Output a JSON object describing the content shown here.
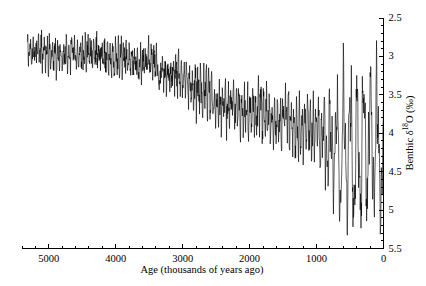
{
  "chart_data": {
    "type": "line",
    "title": "",
    "xlabel": "Age (thousands of years ago)",
    "ylabel_plain": "Benthic d18O (per mil)",
    "ylabel_prefix": "Benthic δ",
    "ylabel_sup": "18",
    "ylabel_suffix": "O (‰)",
    "xlim": [
      5400,
      0
    ],
    "ylim": [
      5.5,
      2.5
    ],
    "x_inverted": true,
    "y_inverted": true,
    "grid": false,
    "legend": false,
    "legend_position": "none",
    "line_color": "#000000",
    "background_color": "#ffffff",
    "axis_position": {
      "x": "bottom",
      "y": "right"
    },
    "xticks": [
      5000,
      4000,
      3000,
      2000,
      1000,
      0
    ],
    "xtick_labels": [
      "5000",
      "4000",
      "3000",
      "2000",
      "1000",
      "0"
    ],
    "x_minor_tick_interval": 200,
    "yticks": [
      2.5,
      3,
      3.5,
      4,
      4.5,
      5,
      5.5
    ],
    "ytick_labels": [
      "2.5",
      "3",
      "3.5",
      "4",
      "4.5",
      "5",
      "5.5"
    ],
    "y_minor_tick_interval": 0.1,
    "series_name": "Benthic δ¹⁸O stack",
    "x_start": 5320,
    "x_end": 0,
    "n_points": 1330,
    "envelope_keypoints": [
      {
        "age": 5320,
        "mean": 2.95,
        "amplitude": 0.24
      },
      {
        "age": 5000,
        "mean": 2.96,
        "amplitude": 0.26
      },
      {
        "age": 4600,
        "mean": 2.99,
        "amplitude": 0.24
      },
      {
        "age": 4300,
        "mean": 2.96,
        "amplitude": 0.22
      },
      {
        "age": 4000,
        "mean": 3.02,
        "amplitude": 0.24
      },
      {
        "age": 3700,
        "mean": 3.06,
        "amplitude": 0.24
      },
      {
        "age": 3400,
        "mean": 3.12,
        "amplitude": 0.28
      },
      {
        "age": 3150,
        "mean": 3.25,
        "amplitude": 0.3
      },
      {
        "age": 2900,
        "mean": 3.33,
        "amplitude": 0.34
      },
      {
        "age": 2700,
        "mean": 3.45,
        "amplitude": 0.4
      },
      {
        "age": 2500,
        "mean": 3.58,
        "amplitude": 0.46
      },
      {
        "age": 2300,
        "mean": 3.66,
        "amplitude": 0.46
      },
      {
        "age": 2100,
        "mean": 3.7,
        "amplitude": 0.44
      },
      {
        "age": 1900,
        "mean": 3.72,
        "amplitude": 0.44
      },
      {
        "age": 1700,
        "mean": 3.78,
        "amplitude": 0.44
      },
      {
        "age": 1500,
        "mean": 3.82,
        "amplitude": 0.46
      },
      {
        "age": 1300,
        "mean": 3.88,
        "amplitude": 0.5
      },
      {
        "age": 1100,
        "mean": 3.95,
        "amplitude": 0.52
      },
      {
        "age": 900,
        "mean": 4.05,
        "amplitude": 0.58
      },
      {
        "age": 700,
        "mean": 4.18,
        "amplitude": 0.7
      },
      {
        "age": 500,
        "mean": 4.22,
        "amplitude": 0.74
      },
      {
        "age": 300,
        "mean": 4.18,
        "amplitude": 0.76
      },
      {
        "age": 150,
        "mean": 4.15,
        "amplitude": 0.78
      },
      {
        "age": 0,
        "mean": 4.05,
        "amplitude": 0.72
      }
    ],
    "notable_events": [
      {
        "age": 3350,
        "value": 3.7,
        "note": "isolated heavy spike"
      },
      {
        "age": 2700,
        "value": 3.95,
        "note": "onset NH glaciation"
      },
      {
        "age": 640,
        "value": 5.1,
        "note": "deepest glacial maximum"
      },
      {
        "age": 430,
        "value": 5.05,
        "note": "MIS 12 glacial"
      },
      {
        "age": 20,
        "value": 5.0,
        "note": "last glacial maximum"
      }
    ]
  }
}
